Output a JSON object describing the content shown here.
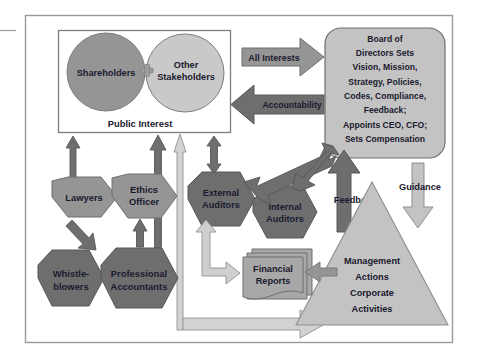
{
  "diagram": {
    "colors": {
      "dark_gray": "#6e6e6e",
      "mid_gray": "#959595",
      "light_gray": "#c3c3c3",
      "pale_gray": "#d2d2d2",
      "outline": "#808080",
      "text": "#1a1a2e",
      "border": "#9a9a9a",
      "background": "#ffffff"
    },
    "public_interest_box": {
      "caption": "Public Interest",
      "circles": [
        {
          "label_lines": [
            "Shareholders"
          ],
          "fill": "#959595"
        },
        {
          "label_lines": [
            "Other",
            "Stakeholders"
          ],
          "fill": "#c9c9c9"
        }
      ],
      "connector_glyph": "plus"
    },
    "board": {
      "lines": [
        "Board of",
        "Directors Sets",
        "Vision, Mission,",
        "Strategy, Policies,",
        "Codes, Compliance,",
        "Feedback;",
        "Appoints CEO, CFO;",
        "Sets Compensation"
      ],
      "fill": "#c3c3c3"
    },
    "triangle": {
      "lines": [
        "Management",
        "Actions",
        "Corporate",
        "Activities"
      ],
      "fill": "#c3c3c3"
    },
    "financial_reports": {
      "lines": [
        "Financial",
        "Reports"
      ],
      "fill": "#a8a8a8"
    },
    "hexagons": [
      {
        "id": "lawyers",
        "lines": [
          "Lawyers"
        ],
        "fill": "#959595"
      },
      {
        "id": "ethics-officer",
        "lines": [
          "Ethics",
          "Officer"
        ],
        "fill": "#959595"
      },
      {
        "id": "whistle-blowers",
        "lines": [
          "Whistle-",
          "blowers"
        ],
        "fill": "#6e6e6e"
      },
      {
        "id": "professional-accountants",
        "lines": [
          "Professional",
          "Accountants"
        ],
        "fill": "#6e6e6e"
      },
      {
        "id": "external-auditors",
        "lines": [
          "External",
          "Auditors"
        ],
        "fill": "#6e6e6e"
      },
      {
        "id": "internal-auditors",
        "lines": [
          "Internal",
          "Auditors"
        ],
        "fill": "#6e6e6e"
      }
    ],
    "arrow_labels": [
      {
        "id": "all-interests",
        "text": "All Interests",
        "direction": "right",
        "fill": "#959595"
      },
      {
        "id": "accountability",
        "text": "Accountability",
        "direction": "left",
        "fill": "#6e6e6e"
      },
      {
        "id": "feedback",
        "text": "Feedback",
        "direction": "up",
        "fill": "#6e6e6e"
      },
      {
        "id": "guidance",
        "text": "Guidance",
        "direction": "down",
        "fill": "#c3c3c3"
      }
    ]
  }
}
